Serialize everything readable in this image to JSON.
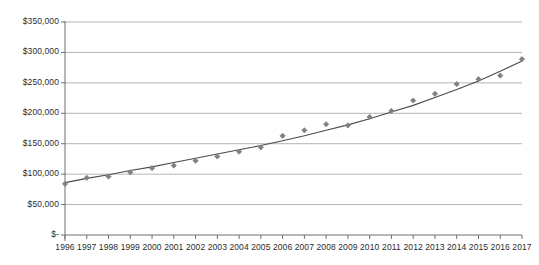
{
  "chart_data": {
    "type": "scatter",
    "title": "",
    "xlabel": "",
    "ylabel": "",
    "grid": true,
    "legend": "none",
    "xlim": [
      1995.5,
      2017.5
    ],
    "ylim": [
      0,
      350000
    ],
    "ytick_labels": [
      "$350,000",
      "$300,000",
      "$250,000",
      "$200,000",
      "$150,000",
      "$100,000",
      "$50,000",
      "$-"
    ],
    "ytick_values": [
      350000,
      300000,
      250000,
      200000,
      150000,
      100000,
      50000,
      0
    ],
    "categories": [
      "1996",
      "1997",
      "1998",
      "1999",
      "2000",
      "2001",
      "2002",
      "2003",
      "2004",
      "2005",
      "2006",
      "2007",
      "2008",
      "2009",
      "2010",
      "2011",
      "2012",
      "2013",
      "2014",
      "2015",
      "2016",
      "2017"
    ],
    "x": [
      1996,
      1997,
      1998,
      1999,
      2000,
      2001,
      2002,
      2003,
      2004,
      2005,
      2006,
      2007,
      2008,
      2009,
      2010,
      2011,
      2012,
      2013,
      2014,
      2015,
      2016,
      2017
    ],
    "series": [
      {
        "name": "Data points",
        "marker": "diamond",
        "color": "#808080",
        "values": [
          84000,
          94000,
          96000,
          103000,
          110000,
          114000,
          122000,
          129000,
          137000,
          144000,
          163000,
          172000,
          182000,
          180000,
          194000,
          204000,
          221000,
          232000,
          248000,
          256000,
          262000,
          289000
        ]
      },
      {
        "name": "Trend line",
        "marker": "none",
        "color": "#4a4a4a",
        "values": [
          86000,
          93000,
          99000,
          106000,
          112000,
          119000,
          126000,
          133000,
          140000,
          147000,
          155000,
          163000,
          172000,
          181000,
          191000,
          202000,
          213000,
          226000,
          239000,
          253000,
          269000,
          286000
        ]
      }
    ]
  },
  "style": {
    "grid_color": "#b4b4b4",
    "axis_color": "#6e6e6e",
    "marker_color": "#808080",
    "line_color": "#4a4a4a",
    "text_color": "#2b2b2b",
    "background": "#ffffff"
  }
}
